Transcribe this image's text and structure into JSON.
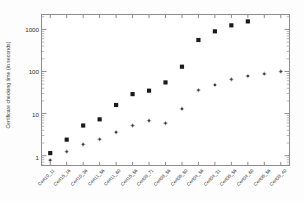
{
  "chart_data": {
    "type": "scatter",
    "title": "",
    "xlabel": "",
    "ylabel": "Certificate checking time (in seconds)",
    "yscale": "log",
    "ylim": [
      0.6,
      2200
    ],
    "grid": false,
    "legend": "none",
    "ytick_labels": [
      "1",
      "10",
      "100",
      "1000"
    ],
    "ytick_values": [
      1,
      10,
      100,
      1000
    ],
    "categories": [
      "Cert10_11",
      "Cert15_16",
      "Cert10_36",
      "Cert11_56",
      "Cert11_60",
      "Cert15_56",
      "Cert08_71",
      "Cert08_56",
      "Cert06_50",
      "Cert04_56",
      "Cert04_31",
      "Cert06_56",
      "Cert04_60",
      "Cert06_56",
      "Cert08_40"
    ],
    "series": [
      {
        "name": "series-squares",
        "marker": "filled-square",
        "color": "#1a1a1a",
        "values": [
          1.15,
          2.4,
          5.2,
          7.3,
          16.0,
          29.0,
          35.0,
          55.0,
          130.0,
          560.0,
          900.0,
          1250.0,
          1550.0,
          null,
          null
        ]
      },
      {
        "name": "series-points",
        "marker": "small-cross",
        "color": "#3d3d3d",
        "values": [
          0.78,
          1.25,
          1.85,
          2.45,
          3.6,
          5.2,
          6.8,
          5.9,
          13.0,
          36.0,
          48.0,
          65.0,
          78.0,
          88.0,
          100.0
        ]
      }
    ]
  }
}
